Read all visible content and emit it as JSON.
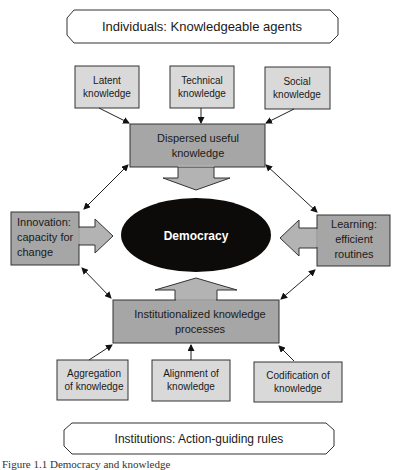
{
  "diagram": {
    "top_banner": "Individuals: Knowledgeable agents",
    "bottom_banner": "Institutions: Action-guiding rules",
    "center": "Democracy",
    "top_inputs": [
      {
        "line1": "Latent",
        "line2": "knowledge"
      },
      {
        "line1": "Technical",
        "line2": "knowledge"
      },
      {
        "line1": "Social",
        "line2": "knowledge"
      }
    ],
    "dispersed": {
      "line1": "Dispersed useful",
      "line2": "knowledge"
    },
    "innovation": {
      "line1": "Innovation:",
      "line2": "capacity for",
      "line3": "change"
    },
    "learning": {
      "line1": "Learning:",
      "line2": "efficient",
      "line3": "routines"
    },
    "institutionalized": {
      "line1": "Institutionalized knowledge",
      "line2": "processes"
    },
    "bottom_inputs": [
      {
        "line1": "Aggregation",
        "line2": "of knowledge"
      },
      {
        "line1": "Alignment of",
        "line2": "knowledge"
      },
      {
        "line1": "Codification of",
        "line2": "knowledge"
      }
    ],
    "colors": {
      "light_box": "#d9d9d9",
      "mid_box": "#a6a6a6",
      "arrow_fill": "#b3b3b3",
      "ellipse": "#0d0a0a",
      "stroke": "#2a2a2a"
    }
  },
  "caption": "Figure 1.1   Democracy and knowledge"
}
